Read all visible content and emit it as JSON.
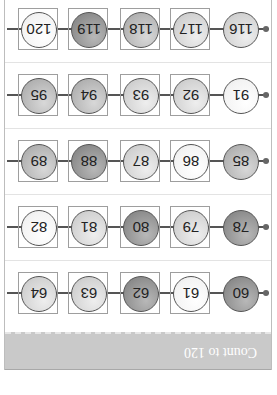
{
  "worksheet": {
    "title": "Count to 120",
    "orientation": "rotated 180 degrees",
    "rows": [
      {
        "beads": [
          {
            "number": "60",
            "shade": "dark",
            "boxed": false
          },
          {
            "number": "61",
            "shade": "white",
            "boxed": true
          },
          {
            "number": "62",
            "shade": "dark",
            "boxed": true
          },
          {
            "number": "63",
            "shade": "light",
            "boxed": true
          },
          {
            "number": "64",
            "shade": "light",
            "boxed": true
          }
        ]
      },
      {
        "beads": [
          {
            "number": "78",
            "shade": "dark",
            "boxed": false
          },
          {
            "number": "79",
            "shade": "light",
            "boxed": true
          },
          {
            "number": "80",
            "shade": "dark",
            "boxed": true
          },
          {
            "number": "81",
            "shade": "light",
            "boxed": true
          },
          {
            "number": "82",
            "shade": "white",
            "boxed": true
          }
        ]
      },
      {
        "beads": [
          {
            "number": "85",
            "shade": "mid",
            "boxed": false
          },
          {
            "number": "86",
            "shade": "white",
            "boxed": true
          },
          {
            "number": "87",
            "shade": "light",
            "boxed": true
          },
          {
            "number": "88",
            "shade": "dark",
            "boxed": true
          },
          {
            "number": "89",
            "shade": "mid",
            "boxed": true
          }
        ]
      },
      {
        "beads": [
          {
            "number": "91",
            "shade": "white",
            "boxed": false
          },
          {
            "number": "92",
            "shade": "light",
            "boxed": true
          },
          {
            "number": "93",
            "shade": "light",
            "boxed": true
          },
          {
            "number": "94",
            "shade": "mid",
            "boxed": true
          },
          {
            "number": "95",
            "shade": "mid",
            "boxed": true
          }
        ]
      },
      {
        "beads": [
          {
            "number": "116",
            "shade": "light",
            "boxed": false
          },
          {
            "number": "117",
            "shade": "light",
            "boxed": true
          },
          {
            "number": "118",
            "shade": "mid",
            "boxed": true
          },
          {
            "number": "119",
            "shade": "dark",
            "boxed": true
          },
          {
            "number": "120",
            "shade": "white",
            "boxed": true
          }
        ]
      }
    ]
  },
  "colors": {
    "header_band": "#c9c9c9",
    "header_text": "#ffffff",
    "bead_dark": "#8e8e8e",
    "bead_mid": "#b4b4b4",
    "bead_light": "#d2d2d2",
    "bead_white": "#f3f3f3",
    "string": "#555555"
  }
}
